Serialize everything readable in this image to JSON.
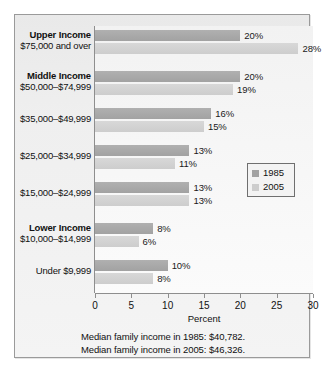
{
  "chart_data": {
    "type": "bar",
    "orientation": "horizontal",
    "title": "",
    "xlabel": "Percent",
    "ylabel": "",
    "xlim": [
      0,
      30
    ],
    "xticks": [
      0,
      5,
      10,
      15,
      20,
      25,
      30
    ],
    "grid": false,
    "legend_position": "right",
    "categories": [
      "$75,000 and over",
      "$50,000–$74,999",
      "$35,000–$49,999",
      "$25,000–$34,999",
      "$15,000–$24,999",
      "$10,000–$14,999",
      "Under $9,999"
    ],
    "category_headings": [
      "Upper Income",
      "Middle Income",
      "",
      "",
      "",
      "Lower Income",
      ""
    ],
    "series": [
      {
        "name": "1985",
        "color": "#a2a2a2",
        "values": [
          20,
          20,
          16,
          13,
          13,
          8,
          10
        ],
        "labels": [
          "20%",
          "20%",
          "16%",
          "13%",
          "13%",
          "8%",
          "10%"
        ]
      },
      {
        "name": "2005",
        "color": "#cdcdcd",
        "values": [
          28,
          19,
          15,
          11,
          13,
          6,
          8
        ],
        "labels": [
          "28%",
          "19%",
          "15%",
          "11%",
          "13%",
          "6%",
          "8%"
        ]
      }
    ],
    "annotations": [
      "Median family income in 1985: $40,782.",
      "Median family income in 2005: $46,326."
    ]
  },
  "legend": {
    "items": [
      {
        "label": "1985"
      },
      {
        "label": "2005"
      }
    ]
  },
  "axis": {
    "tick_labels": [
      "0",
      "5",
      "10",
      "15",
      "20",
      "25",
      "30"
    ],
    "xlabel": "Percent"
  },
  "notes": {
    "line1": "Median family income in 1985: $40,782.",
    "line2": "Median family income in 2005: $46,326."
  }
}
